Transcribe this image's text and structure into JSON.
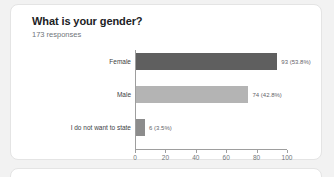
{
  "card": {
    "title": "What is your gender?",
    "responses": "173 responses"
  },
  "chart_data": {
    "type": "bar",
    "orientation": "horizontal",
    "title": "What is your gender?",
    "subtitle": "173 responses",
    "total_responses": 173,
    "categories": [
      "Female",
      "Male",
      "I do not want to state"
    ],
    "values": [
      93,
      74,
      6
    ],
    "percent_labels": [
      "93 (53.8%)",
      "74 (42.8%)",
      "6 (3.5%)"
    ],
    "percents": [
      53.8,
      42.8,
      3.5
    ],
    "bar_colors": [
      "#5f5f5f",
      "#b4b4b4",
      "#8c8c8c"
    ],
    "xlabel": "",
    "ylabel": "",
    "xlim": [
      0,
      100
    ],
    "xticks": [
      0,
      20,
      40,
      60,
      80,
      100
    ],
    "xtick_labels": [
      "0",
      "20",
      "40",
      "60",
      "80",
      "100"
    ],
    "grid": false,
    "legend": false
  },
  "colors": {
    "card_background": "#ffffff",
    "page_background": "#f2f2f2",
    "title_text": "#202124",
    "muted_text": "#70757a",
    "axis": "#9e9e9e"
  }
}
